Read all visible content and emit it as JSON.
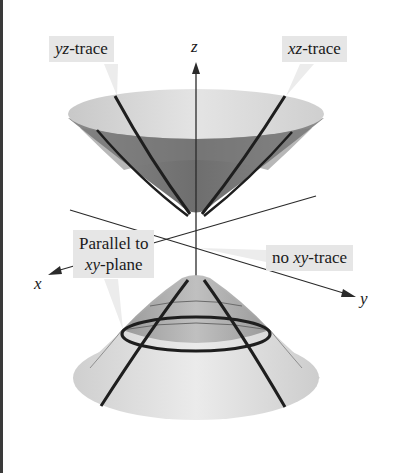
{
  "figure": {
    "axes": {
      "x_label": "x",
      "y_label": "y",
      "z_label": "z"
    },
    "labels": {
      "yz_trace": {
        "italic": "yz",
        "rest": "-trace"
      },
      "xz_trace": {
        "italic": "xz",
        "rest": "-trace"
      },
      "parallel_line1": "Parallel to",
      "parallel_line2_italic": "xy",
      "parallel_line2_rest": "-plane",
      "no_xy_prefix": "no ",
      "no_xy_italic": "xy",
      "no_xy_rest": "-trace"
    },
    "colors": {
      "background": "#ffffff",
      "label_box": "#e6e6e6",
      "surface_dark": "#7a7a7a",
      "surface_light": "#d4d4d4",
      "trace_line": "#1e1e1e",
      "axis": "#2a2a2a"
    }
  }
}
